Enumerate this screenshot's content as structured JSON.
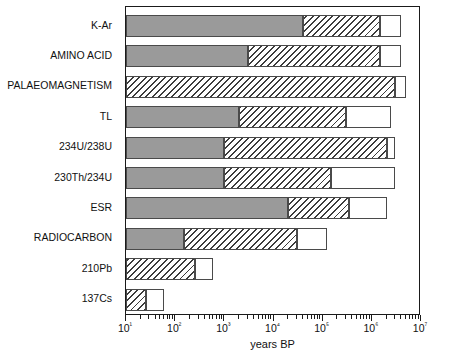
{
  "chart_data": {
    "type": "bar",
    "orientation": "horizontal",
    "title": "",
    "xlabel": "years BP",
    "ylabel": "",
    "xscale": "log",
    "xlim": [
      10,
      10000000
    ],
    "grid": false,
    "legend_position": "inside-lower-right",
    "x_tick_labels": [
      "10¹",
      "10²",
      "10³",
      "10⁴",
      "10⁵",
      "10⁶",
      "10⁷"
    ],
    "x_tick_values": [
      10,
      100,
      1000,
      10000,
      100000,
      1000000,
      10000000
    ],
    "categories": [
      "K-Ar",
      "AMINO ACID",
      "PALAEOMAGNETISM",
      "TL",
      "234U/238U",
      "230Th/234U",
      "ESR",
      "RADIOCARBON",
      "210Pb",
      "137Cs"
    ],
    "series": [
      {
        "name": "minimum age",
        "key": "min",
        "color": "#9a9a9a",
        "fill": "solid",
        "values": [
          40000,
          3000,
          10,
          2000,
          1000,
          1000,
          20000,
          150,
          10,
          10
        ]
      },
      {
        "name": "reliable age",
        "key": "reliable",
        "color": "#ffffff",
        "fill": "hatched",
        "values": [
          1500000,
          1500000,
          3000000,
          300000,
          2000000,
          150000,
          350000,
          30000,
          250,
          25
        ]
      },
      {
        "name": "maximum age",
        "key": "max",
        "color": "#ffffff",
        "fill": "empty",
        "values": [
          4000000,
          4000000,
          5000000,
          2500000,
          3000000,
          3000000,
          2000000,
          120000,
          600,
          60
        ]
      }
    ],
    "bars": [
      {
        "category": "K-Ar",
        "min_start": 10,
        "min_end": 40000,
        "reliable_end": 1500000,
        "max_end": 4000000
      },
      {
        "category": "AMINO ACID",
        "min_start": 10,
        "min_end": 3000,
        "reliable_end": 1500000,
        "max_end": 4000000
      },
      {
        "category": "PALAEOMAGNETISM",
        "min_start": 10,
        "min_end": 10,
        "reliable_end": 3000000,
        "max_end": 5000000
      },
      {
        "category": "TL",
        "min_start": 10,
        "min_end": 2000,
        "reliable_end": 300000,
        "max_end": 2500000
      },
      {
        "category": "234U/238U",
        "min_start": 10,
        "min_end": 1000,
        "reliable_end": 2000000,
        "max_end": 3000000
      },
      {
        "category": "230Th/234U",
        "min_start": 10,
        "min_end": 1000,
        "reliable_end": 150000,
        "max_end": 3000000
      },
      {
        "category": "ESR",
        "min_start": 10,
        "min_end": 20000,
        "reliable_end": 350000,
        "max_end": 2000000
      },
      {
        "category": "RADIOCARBON",
        "min_start": 10,
        "min_end": 150,
        "reliable_end": 30000,
        "max_end": 120000
      },
      {
        "category": "210Pb",
        "min_start": 10,
        "min_end": 10,
        "reliable_end": 250,
        "max_end": 600
      },
      {
        "category": "137Cs",
        "min_start": 10,
        "min_end": 10,
        "reliable_end": 25,
        "max_end": 60
      }
    ],
    "legend_entries": [
      {
        "label": "minimum age",
        "swatch": "min"
      },
      {
        "label": "reliable age",
        "swatch": "rel"
      },
      {
        "label": "maximum age",
        "swatch": "max"
      }
    ]
  }
}
